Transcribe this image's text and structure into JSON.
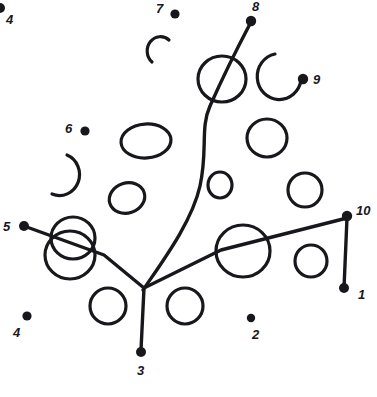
{
  "artwork": {
    "title": "Connect-the-dots puzzle drawing",
    "kind": "dot-to-dot line art",
    "background_color": "#ffffff",
    "ink_color": "#18171c",
    "canvas": {
      "width": 377,
      "height": 397
    }
  },
  "dots": [
    {
      "id": "dot-1",
      "label": "1",
      "cx": 344,
      "cy": 288,
      "r": 5.0,
      "label_x": 358,
      "label_y": 299,
      "label_size": 13
    },
    {
      "id": "dot-2",
      "label": "2",
      "cx": 251,
      "cy": 318,
      "r": 4.2,
      "label_x": 252,
      "label_y": 339,
      "label_size": 13
    },
    {
      "id": "dot-3",
      "label": "3",
      "cx": 141,
      "cy": 352,
      "r": 5.0,
      "label_x": 137,
      "label_y": 375,
      "label_size": 13
    },
    {
      "id": "dot-4a",
      "label": "4",
      "cx": 0,
      "cy": 8,
      "r": 5.0,
      "label_x": 6,
      "label_y": 24,
      "label_size": 13
    },
    {
      "id": "dot-4b",
      "label": "4",
      "cx": 27,
      "cy": 316,
      "r": 4.6,
      "label_x": 13,
      "label_y": 337,
      "label_size": 13
    },
    {
      "id": "dot-5",
      "label": "5",
      "cx": 24,
      "cy": 226,
      "r": 5.0,
      "label_x": 3,
      "label_y": 231,
      "label_size": 13
    },
    {
      "id": "dot-6",
      "label": "6",
      "cx": 85,
      "cy": 131,
      "r": 4.6,
      "label_x": 65,
      "label_y": 133,
      "label_size": 13
    },
    {
      "id": "dot-7",
      "label": "7",
      "cx": 175,
      "cy": 14,
      "r": 4.6,
      "label_x": 156,
      "label_y": 13,
      "label_size": 13
    },
    {
      "id": "dot-8",
      "label": "8",
      "cx": 251,
      "cy": 21,
      "r": 5.2,
      "label_x": 252,
      "label_y": 11,
      "label_size": 13
    },
    {
      "id": "dot-9",
      "label": "9",
      "cx": 303,
      "cy": 79,
      "r": 5.2,
      "label_x": 313,
      "label_y": 84,
      "label_size": 13
    },
    {
      "id": "dot-10",
      "label": "10",
      "cx": 347,
      "cy": 216,
      "r": 5.2,
      "label_x": 356,
      "label_y": 215,
      "label_size": 13
    }
  ],
  "strokes": {
    "branch_junction": {
      "x": 144,
      "y": 288
    },
    "segments": [
      {
        "name": "stem-to-dot-3",
        "d": "M 144 288 L 141 350"
      },
      {
        "name": "left-branch",
        "d": "M 144 288 L 104 255 L 24 226"
      },
      {
        "name": "right-branch",
        "d": "M 144 288 L 221 250 L 347 218"
      },
      {
        "name": "right-vertical",
        "d": "M 347 218 L 344 288"
      },
      {
        "name": "curved-trunk",
        "d": "M 143 290 C 162 262, 192 222, 200 186 C 208 150, 200 128, 210 106 C 218 88, 232 58, 251 22"
      }
    ],
    "arcs": [
      {
        "name": "arc-near-7",
        "d": "M 169 40 A 13 14 0 1 0 152 62"
      },
      {
        "name": "arc-near-6",
        "d": "M 67 155 A 20 21 0 1 1 52 194"
      },
      {
        "name": "arc-near-9",
        "d": "M 275 54 A 22 23 0 1 0 301 80"
      }
    ],
    "blobs": [
      {
        "name": "blob-top-center",
        "cx": 222,
        "cy": 79,
        "rx": 24,
        "ry": 23,
        "rot": 0
      },
      {
        "name": "blob-mid-left",
        "cx": 146,
        "cy": 141,
        "rx": 25,
        "ry": 17,
        "rot": -4
      },
      {
        "name": "blob-mid-right",
        "cx": 267,
        "cy": 138,
        "rx": 20,
        "ry": 19,
        "rot": 0
      },
      {
        "name": "blob-small-center",
        "cx": 220,
        "cy": 185,
        "rx": 12,
        "ry": 13,
        "rot": 0
      },
      {
        "name": "blob-small-left",
        "cx": 127,
        "cy": 198,
        "rx": 18,
        "ry": 15,
        "rot": -18
      },
      {
        "name": "blob-small-right",
        "cx": 305,
        "cy": 190,
        "rx": 17,
        "ry": 17,
        "rot": 0
      },
      {
        "name": "blob-pair-upper",
        "cx": 73,
        "cy": 238,
        "rx": 22,
        "ry": 21,
        "rot": 0
      },
      {
        "name": "blob-pair-lower",
        "cx": 70,
        "cy": 255,
        "rx": 25,
        "ry": 24,
        "rot": 0
      },
      {
        "name": "blob-big-right",
        "cx": 243,
        "cy": 251,
        "rx": 27,
        "ry": 26,
        "rot": 0
      },
      {
        "name": "blob-far-right",
        "cx": 311,
        "cy": 261,
        "rx": 16,
        "ry": 16,
        "rot": 0
      },
      {
        "name": "blob-bottom-left",
        "cx": 108,
        "cy": 306,
        "rx": 18,
        "ry": 18,
        "rot": 0
      },
      {
        "name": "blob-bottom-mid",
        "cx": 185,
        "cy": 306,
        "rx": 18,
        "ry": 18,
        "rot": 0
      }
    ]
  }
}
